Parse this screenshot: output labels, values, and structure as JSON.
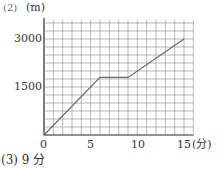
{
  "header": {
    "part_label": "(2)",
    "y_unit": "(m)"
  },
  "footer": {
    "answer": "(3) 9 分"
  },
  "chart_data": {
    "type": "line",
    "title": "",
    "xlabel": "(分)",
    "ylabel": "(m)",
    "x_ticks": [
      "0",
      "5",
      "10",
      "15"
    ],
    "y_ticks": [
      "1500",
      "3000"
    ],
    "xlim": [
      0,
      16
    ],
    "ylim": [
      0,
      3600
    ],
    "grid": true,
    "series": [
      {
        "name": "distance",
        "x": [
          0,
          6,
          9,
          15
        ],
        "y": [
          0,
          1800,
          1800,
          3000
        ]
      }
    ]
  }
}
